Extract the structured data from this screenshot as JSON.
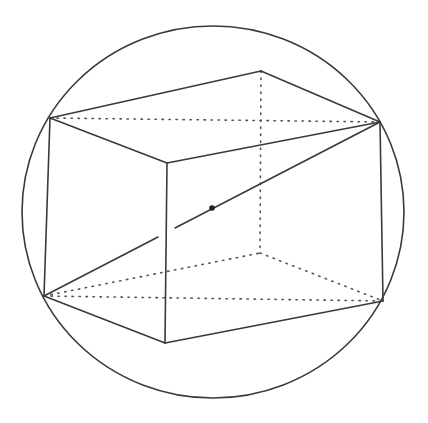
{
  "figure": {
    "type": "cuboid-inscribed-in-sphere",
    "colors": {
      "line": "#3a3a3a",
      "hidden_line": "#555555",
      "background": "#ffffff"
    },
    "sphere": {
      "cx": 213,
      "cy": 212,
      "rx": 191,
      "ry": 186
    },
    "vertices": {
      "A": [
        50,
        118
      ],
      "B": [
        261,
        71
      ],
      "C": [
        380,
        122
      ],
      "D": [
        167,
        163
      ],
      "E": [
        44,
        296
      ],
      "F": [
        165,
        343
      ],
      "G": [
        383,
        301
      ],
      "H": [
        260,
        253
      ]
    },
    "center": [
      212,
      208
    ],
    "visible_edges": [
      [
        "A",
        "B"
      ],
      [
        "B",
        "C"
      ],
      [
        "A",
        "D"
      ],
      [
        "D",
        "C"
      ],
      [
        "A",
        "E"
      ],
      [
        "D",
        "F"
      ],
      [
        "C",
        "G"
      ],
      [
        "E",
        "F"
      ],
      [
        "F",
        "G"
      ]
    ],
    "hidden_edges": [
      [
        "A",
        "C"
      ],
      [
        "B",
        "H"
      ],
      [
        "H",
        "E"
      ],
      [
        "H",
        "G"
      ],
      [
        "E",
        "G"
      ]
    ],
    "space_diagonal": {
      "from": "E",
      "to": "C",
      "gap_at_x": [
        157,
        175
      ]
    }
  }
}
